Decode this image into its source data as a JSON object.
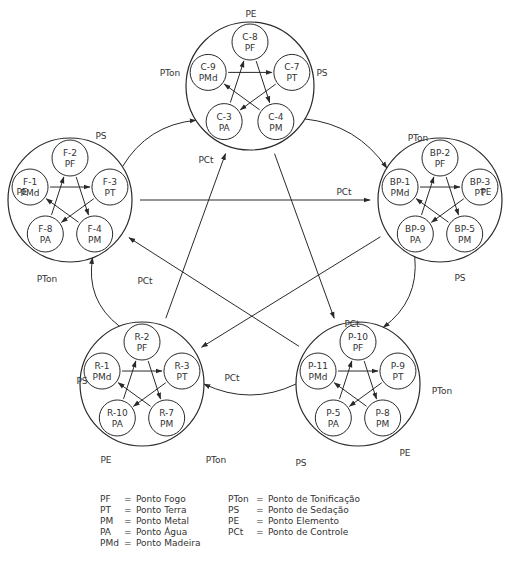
{
  "groups": [
    {
      "id": "C",
      "cx": 250,
      "cy": 86,
      "r": 64,
      "points": [
        {
          "code": "C-8",
          "type": "PF"
        },
        {
          "code": "C-7",
          "type": "PT"
        },
        {
          "code": "C-4",
          "type": "PM"
        },
        {
          "code": "C-3",
          "type": "PA"
        },
        {
          "code": "C-9",
          "type": "PMd"
        }
      ],
      "labels": [
        {
          "text": "PE",
          "x": 251,
          "y": 17
        },
        {
          "text": "PS",
          "x": 322,
          "y": 76
        },
        {
          "text": "PCt",
          "x": 206,
          "y": 163
        },
        {
          "text": "PTon",
          "x": 170,
          "y": 76
        }
      ]
    },
    {
      "id": "F",
      "cx": 70,
      "cy": 200,
      "r": 62,
      "points": [
        {
          "code": "F-2",
          "type": "PF"
        },
        {
          "code": "F-3",
          "type": "PT"
        },
        {
          "code": "F-4",
          "type": "PM"
        },
        {
          "code": "F-8",
          "type": "PA"
        },
        {
          "code": "F-1",
          "type": "PMd"
        }
      ],
      "labels": [
        {
          "text": "PS",
          "x": 101,
          "y": 139
        },
        {
          "text": "PE",
          "x": 22,
          "y": 195
        },
        {
          "text": "PTon",
          "x": 47,
          "y": 282
        },
        {
          "text": "PCt",
          "x": 145,
          "y": 284
        }
      ]
    },
    {
      "id": "BP",
      "cx": 440,
      "cy": 200,
      "r": 62,
      "points": [
        {
          "code": "BP-2",
          "type": "PF"
        },
        {
          "code": "BP-3",
          "type": "PT"
        },
        {
          "code": "BP-5",
          "type": "PM"
        },
        {
          "code": "BP-9",
          "type": "PA"
        },
        {
          "code": "BP-1",
          "type": "PMd"
        }
      ],
      "labels": [
        {
          "text": "PTon",
          "x": 418,
          "y": 141
        },
        {
          "text": "PE",
          "x": 486,
          "y": 195
        },
        {
          "text": "PS",
          "x": 460,
          "y": 281
        },
        {
          "text": "PCt",
          "x": 344,
          "y": 195
        }
      ]
    },
    {
      "id": "R",
      "cx": 142,
      "cy": 384,
      "r": 62,
      "points": [
        {
          "code": "R-2",
          "type": "PF"
        },
        {
          "code": "R-3",
          "type": "PT"
        },
        {
          "code": "R-7",
          "type": "PM"
        },
        {
          "code": "R-10",
          "type": "PA"
        },
        {
          "code": "R-1",
          "type": "PMd"
        }
      ],
      "labels": [
        {
          "text": "PS",
          "x": 82,
          "y": 384
        },
        {
          "text": "PCt",
          "x": 232,
          "y": 381
        },
        {
          "text": "PE",
          "x": 106,
          "y": 463
        },
        {
          "text": "PTon",
          "x": 216,
          "y": 463
        }
      ]
    },
    {
      "id": "P",
      "cx": 358,
      "cy": 384,
      "r": 62,
      "points": [
        {
          "code": "P-10",
          "type": "PF"
        },
        {
          "code": "P-9",
          "type": "PT"
        },
        {
          "code": "P-8",
          "type": "PM"
        },
        {
          "code": "P-5",
          "type": "PA"
        },
        {
          "code": "P-11",
          "type": "PMd"
        }
      ],
      "labels": [
        {
          "text": "PCt",
          "x": 352,
          "y": 327
        },
        {
          "text": "PTon",
          "x": 442,
          "y": 394
        },
        {
          "text": "PS",
          "x": 301,
          "y": 466
        },
        {
          "text": "PE",
          "x": 405,
          "y": 456
        }
      ]
    }
  ],
  "legend": {
    "left": [
      {
        "abbr": "PF",
        "eq": "=",
        "desc": "Ponto Fogo"
      },
      {
        "abbr": "PT",
        "eq": "=",
        "desc": "Ponto Terra"
      },
      {
        "abbr": "PM",
        "eq": "=",
        "desc": "Ponto Metal"
      },
      {
        "abbr": "PA",
        "eq": "=",
        "desc": "Ponto Água"
      },
      {
        "abbr": "PMd",
        "eq": "=",
        "desc": "Ponto Madeira"
      }
    ],
    "right": [
      {
        "abbr": "PTon",
        "eq": "=",
        "desc": "Ponto de Tonificação"
      },
      {
        "abbr": "PS",
        "eq": "=",
        "desc": "Ponto de Sedação"
      },
      {
        "abbr": "PE",
        "eq": "=",
        "desc": "Ponto Elemento"
      },
      {
        "abbr": "PCt",
        "eq": "=",
        "desc": "Ponto de Controle"
      }
    ]
  },
  "colors": {
    "stroke": "#2a2a2a",
    "text": "#333333",
    "background": "#ffffff"
  }
}
